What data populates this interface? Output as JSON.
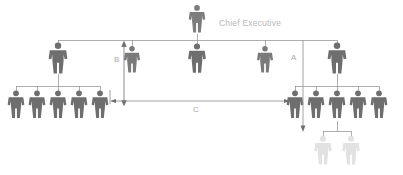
{
  "diagram": {
    "title_label": "Chief Executive",
    "type": "organizational-chart-span-of-control",
    "colors": {
      "figure_dark": "#6e6e6e",
      "figure_mid": "#7a7a7a",
      "figure_ghost": "#e2e2e2",
      "connector": "#8c8c8c",
      "annotation_line": "#6e6e6e",
      "label_text": "#b9b9b9",
      "background": "#ffffff"
    },
    "annotations": [
      {
        "id": "A",
        "label": "A",
        "orientation": "vertical",
        "arrow": "down"
      },
      {
        "id": "B",
        "label": "B",
        "orientation": "vertical",
        "arrow": "both"
      },
      {
        "id": "C",
        "label": "C",
        "orientation": "horizontal",
        "arrow": "both"
      }
    ],
    "levels": [
      {
        "name": "executive",
        "count": 1,
        "nodes": [
          {
            "name": "chief-executive",
            "label": "Chief Executive"
          }
        ]
      },
      {
        "name": "senior-managers",
        "count": 6,
        "nodes": [
          {
            "name": "manager-1",
            "label": ""
          },
          {
            "name": "manager-2",
            "label": ""
          },
          {
            "name": "manager-3",
            "label": ""
          },
          {
            "name": "manager-4",
            "label": ""
          },
          {
            "name": "manager-5",
            "label": ""
          },
          {
            "name": "manager-6",
            "label": ""
          }
        ]
      },
      {
        "name": "staff-left",
        "count": 5,
        "nodes": [
          {
            "name": "staff-left-1",
            "label": ""
          },
          {
            "name": "staff-left-2",
            "label": ""
          },
          {
            "name": "staff-left-3",
            "label": ""
          },
          {
            "name": "staff-left-4",
            "label": ""
          },
          {
            "name": "staff-left-5",
            "label": ""
          }
        ]
      },
      {
        "name": "staff-right",
        "count": 5,
        "nodes": [
          {
            "name": "staff-right-1",
            "label": ""
          },
          {
            "name": "staff-right-2",
            "label": ""
          },
          {
            "name": "staff-right-3",
            "label": ""
          },
          {
            "name": "staff-right-4",
            "label": ""
          },
          {
            "name": "staff-right-5",
            "label": ""
          }
        ]
      },
      {
        "name": "staff-ghost",
        "count": 2,
        "nodes": [
          {
            "name": "ghost-1",
            "label": ""
          },
          {
            "name": "ghost-2",
            "label": ""
          }
        ]
      }
    ]
  }
}
